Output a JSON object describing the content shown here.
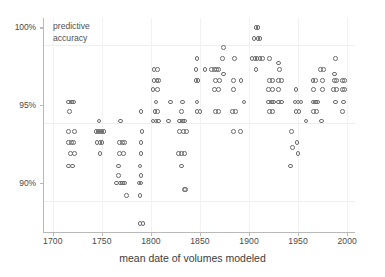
{
  "chart_data": {
    "type": "scatter",
    "title": "",
    "annotation": "predictive\naccuracy",
    "annotation_lines": [
      "predictive",
      "accuracy"
    ],
    "xlabel": "mean date of volumes modeled",
    "ylabel": "predictive accuracy",
    "xlim": [
      1690,
      2008
    ],
    "ylim": [
      86.8,
      100.6
    ],
    "xticks": [
      1700,
      1750,
      1800,
      1850,
      1900,
      1950,
      2000
    ],
    "xtick_labels": [
      "1700",
      "1750",
      "1800",
      "1850",
      "1900",
      "1950",
      "2000"
    ],
    "yticks": [
      90,
      95,
      100
    ],
    "ytick_labels": [
      "90%",
      "95%",
      "100%"
    ],
    "grid": true,
    "marker": "open-circle",
    "marker_color": "#6d6d6d",
    "points": [
      [
        1716,
        95.2
      ],
      [
        1719,
        95.2
      ],
      [
        1721,
        95.2
      ],
      [
        1717,
        94.6
      ],
      [
        1716,
        93.3
      ],
      [
        1722,
        93.3
      ],
      [
        1716,
        92.6
      ],
      [
        1719,
        92.6
      ],
      [
        1721,
        92.6
      ],
      [
        1718,
        91.9
      ],
      [
        1722,
        91.9
      ],
      [
        1716,
        91.1
      ],
      [
        1720,
        91.1
      ],
      [
        1747,
        94.0
      ],
      [
        1744,
        93.3
      ],
      [
        1746,
        93.3
      ],
      [
        1748,
        93.3
      ],
      [
        1750,
        93.3
      ],
      [
        1752,
        93.3
      ],
      [
        1745,
        92.6
      ],
      [
        1748,
        92.6
      ],
      [
        1750,
        92.6
      ],
      [
        1748,
        91.9
      ],
      [
        1769,
        94.0
      ],
      [
        1768,
        92.6
      ],
      [
        1771,
        92.6
      ],
      [
        1773,
        92.6
      ],
      [
        1768,
        91.9
      ],
      [
        1772,
        91.9
      ],
      [
        1767,
        91.1
      ],
      [
        1767,
        90.5
      ],
      [
        1765,
        90.0
      ],
      [
        1769,
        90.0
      ],
      [
        1771,
        90.0
      ],
      [
        1773,
        90.0
      ],
      [
        1775,
        89.2
      ],
      [
        1790,
        94.6
      ],
      [
        1791,
        93.3
      ],
      [
        1790,
        92.6
      ],
      [
        1790,
        91.9
      ],
      [
        1789,
        91.1
      ],
      [
        1790,
        90.5
      ],
      [
        1788,
        90.0
      ],
      [
        1790,
        90.0
      ],
      [
        1789,
        89.2
      ],
      [
        1789,
        87.4
      ],
      [
        1792,
        87.4
      ],
      [
        1803,
        97.3
      ],
      [
        1807,
        97.3
      ],
      [
        1803,
        96.6
      ],
      [
        1806,
        96.6
      ],
      [
        1808,
        96.6
      ],
      [
        1802,
        96.0
      ],
      [
        1807,
        96.0
      ],
      [
        1805,
        95.2
      ],
      [
        1804,
        94.6
      ],
      [
        1807,
        94.6
      ],
      [
        1802,
        94.0
      ],
      [
        1805,
        94.0
      ],
      [
        1808,
        94.0
      ],
      [
        1820,
        95.2
      ],
      [
        1818,
        94.0
      ],
      [
        1832,
        95.2
      ],
      [
        1831,
        94.6
      ],
      [
        1829,
        94.0
      ],
      [
        1832,
        94.0
      ],
      [
        1834,
        94.0
      ],
      [
        1829,
        93.3
      ],
      [
        1833,
        93.3
      ],
      [
        1836,
        93.3
      ],
      [
        1828,
        91.9
      ],
      [
        1831,
        91.9
      ],
      [
        1834,
        91.9
      ],
      [
        1831,
        91.1
      ],
      [
        1834,
        89.6
      ],
      [
        1835,
        89.6
      ],
      [
        1847,
        98.0
      ],
      [
        1846,
        97.3
      ],
      [
        1846,
        96.6
      ],
      [
        1848,
        96.6
      ],
      [
        1847,
        95.2
      ],
      [
        1847,
        94.6
      ],
      [
        1850,
        94.6
      ],
      [
        1855,
        97.3
      ],
      [
        1862,
        97.3
      ],
      [
        1865,
        97.3
      ],
      [
        1867,
        97.3
      ],
      [
        1869,
        97.3
      ],
      [
        1866,
        96.6
      ],
      [
        1870,
        96.6
      ],
      [
        1865,
        96.0
      ],
      [
        1869,
        96.0
      ],
      [
        1866,
        94.6
      ],
      [
        1869,
        94.6
      ],
      [
        1874,
        98.7
      ],
      [
        1873,
        98.0
      ],
      [
        1874,
        97.0
      ],
      [
        1885,
        98.0
      ],
      [
        1884,
        96.6
      ],
      [
        1884,
        96.0
      ],
      [
        1883,
        94.6
      ],
      [
        1886,
        94.6
      ],
      [
        1884,
        93.3
      ],
      [
        1892,
        96.6
      ],
      [
        1891,
        93.3
      ],
      [
        1895,
        95.2
      ],
      [
        1907,
        100.0
      ],
      [
        1909,
        100.0
      ],
      [
        1905,
        99.3
      ],
      [
        1909,
        99.3
      ],
      [
        1911,
        99.3
      ],
      [
        1903,
        98.0
      ],
      [
        1906,
        98.0
      ],
      [
        1908,
        98.0
      ],
      [
        1911,
        98.0
      ],
      [
        1914,
        98.0
      ],
      [
        1907,
        97.3
      ],
      [
        1921,
        98.0
      ],
      [
        1921,
        96.6
      ],
      [
        1924,
        96.6
      ],
      [
        1920,
        96.0
      ],
      [
        1924,
        96.0
      ],
      [
        1920,
        95.2
      ],
      [
        1923,
        95.2
      ],
      [
        1925,
        95.2
      ],
      [
        1921,
        94.6
      ],
      [
        1924,
        94.6
      ],
      [
        1930,
        97.7
      ],
      [
        1931,
        97.3
      ],
      [
        1930,
        96.6
      ],
      [
        1933,
        96.6
      ],
      [
        1930,
        96.0
      ],
      [
        1930,
        95.2
      ],
      [
        1933,
        95.2
      ],
      [
        1943,
        93.3
      ],
      [
        1944,
        92.3
      ],
      [
        1942,
        91.1
      ],
      [
        1948,
        96.0
      ],
      [
        1947,
        95.2
      ],
      [
        1950,
        95.2
      ],
      [
        1953,
        95.2
      ],
      [
        1948,
        94.6
      ],
      [
        1951,
        94.6
      ],
      [
        1949,
        92.6
      ],
      [
        1950,
        91.9
      ],
      [
        1958,
        94.0
      ],
      [
        1965,
        96.6
      ],
      [
        1968,
        96.6
      ],
      [
        1966,
        96.0
      ],
      [
        1965,
        95.2
      ],
      [
        1968,
        95.2
      ],
      [
        1970,
        95.2
      ],
      [
        1966,
        94.6
      ],
      [
        1969,
        94.6
      ],
      [
        1973,
        97.3
      ],
      [
        1976,
        97.3
      ],
      [
        1975,
        96.6
      ],
      [
        1975,
        96.0
      ],
      [
        1974,
        94.0
      ],
      [
        1988,
        98.0
      ],
      [
        1987,
        97.0
      ],
      [
        1987,
        96.6
      ],
      [
        1989,
        96.6
      ],
      [
        1986,
        96.0
      ],
      [
        1989,
        96.0
      ],
      [
        1988,
        95.2
      ],
      [
        1995,
        96.6
      ],
      [
        1997,
        96.6
      ],
      [
        1995,
        96.0
      ],
      [
        1997,
        96.0
      ],
      [
        1996,
        95.2
      ],
      [
        1995,
        94.6
      ]
    ]
  }
}
